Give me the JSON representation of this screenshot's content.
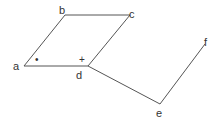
{
  "diagram": {
    "points": {
      "a": {
        "label": "a",
        "x": 24,
        "y": 66
      },
      "b": {
        "label": "b",
        "x": 65,
        "y": 15
      },
      "c": {
        "label": "c",
        "x": 130,
        "y": 15
      },
      "d": {
        "label": "d",
        "x": 88,
        "y": 66
      },
      "e": {
        "label": "e",
        "x": 160,
        "y": 104
      },
      "f": {
        "label": "f",
        "x": 205,
        "y": 44
      }
    },
    "segments": [
      [
        "a",
        "b"
      ],
      [
        "b",
        "c"
      ],
      [
        "c",
        "d"
      ],
      [
        "d",
        "a"
      ],
      [
        "d",
        "e"
      ],
      [
        "e",
        "f"
      ]
    ],
    "angle_marks": {
      "at_a": "•",
      "at_d": "+"
    },
    "line_color": "#555555"
  }
}
